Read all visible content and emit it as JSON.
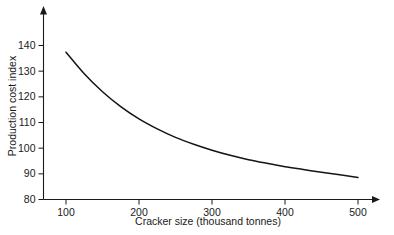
{
  "chart_data": {
    "type": "line",
    "title": "",
    "xlabel": "Cracker size (thousand tonnes)",
    "ylabel": "Production cost index",
    "xlim": [
      80,
      520
    ],
    "ylim": [
      80,
      143
    ],
    "grid": false,
    "legend": "none",
    "xticks": [
      100,
      200,
      300,
      400,
      500
    ],
    "xtick_labels": [
      "100",
      "200",
      "300",
      "400",
      "500"
    ],
    "yticks": [
      80,
      90,
      100,
      110,
      120,
      130,
      140
    ],
    "ytick_labels": [
      "80",
      "90",
      "100",
      "110",
      "120",
      "130",
      "140"
    ],
    "x": [
      100,
      125,
      150,
      175,
      200,
      225,
      250,
      275,
      300,
      325,
      350,
      375,
      400,
      425,
      450,
      475,
      500
    ],
    "values": [
      137.4,
      129.0,
      122.0,
      116.2,
      111.4,
      107.5,
      104.2,
      101.5,
      99.2,
      97.2,
      95.5,
      94.1,
      92.8,
      91.7,
      90.6,
      89.6,
      88.6
    ],
    "series": [
      {
        "name": "Production cost index",
        "color": "#141414",
        "x": [
          100,
          125,
          150,
          175,
          200,
          225,
          250,
          275,
          300,
          325,
          350,
          375,
          400,
          425,
          450,
          475,
          500
        ],
        "values": [
          137.4,
          129.0,
          122.0,
          116.2,
          111.4,
          107.5,
          104.2,
          101.5,
          99.2,
          97.2,
          95.5,
          94.1,
          92.8,
          91.7,
          90.6,
          89.6,
          88.6
        ]
      }
    ],
    "annotations": []
  },
  "axes": {
    "y_axis_name": "y-axis",
    "x_axis_name": "x-axis",
    "arrow_y_name": "y-axis-arrow",
    "arrow_x_name": "x-axis-arrow"
  },
  "colors": {
    "background": "#ffffff",
    "axis": "#1a1a1a",
    "curve": "#141414",
    "text": "#1a1a1a"
  }
}
